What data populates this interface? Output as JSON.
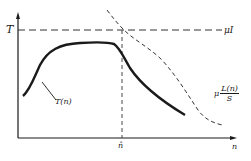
{
  "diagram": {
    "y_axis_label": "T",
    "x_axis_label": "n",
    "x_marker_label": "n̂",
    "horizontal_line_label": "μI",
    "curve_solid_label": "T(n)",
    "curve_dashed_label_prefix": "μ",
    "curve_dashed_label_num": "L(n)",
    "curve_dashed_label_den": "S",
    "colors": {
      "ink": "#1a1a1a",
      "background": "#ffffff"
    }
  }
}
